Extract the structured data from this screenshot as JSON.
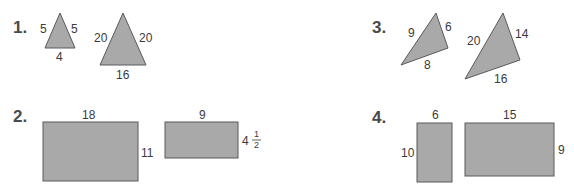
{
  "problems": [
    {
      "number": "1.",
      "type": "triangles",
      "figures": [
        {
          "sides": {
            "left": "5",
            "right": "5",
            "bottom": "4"
          }
        },
        {
          "sides": {
            "left": "20",
            "right": "20",
            "bottom": "16"
          }
        }
      ]
    },
    {
      "number": "2.",
      "type": "rectangles",
      "figures": [
        {
          "width": "18",
          "height": "11"
        },
        {
          "width": "9",
          "height_whole": "4",
          "height_frac_num": "1",
          "height_frac_den": "2"
        }
      ]
    },
    {
      "number": "3.",
      "type": "triangles",
      "figures": [
        {
          "sides": {
            "left": "9",
            "right": "6",
            "bottom": "8"
          }
        },
        {
          "sides": {
            "left": "20",
            "right": "14",
            "bottom": "16"
          }
        }
      ]
    },
    {
      "number": "4.",
      "type": "rectangles",
      "figures": [
        {
          "width": "6",
          "height": "10"
        },
        {
          "width": "15",
          "height": "9"
        }
      ]
    }
  ],
  "colors": {
    "fill": "#a9a9a9",
    "stroke": "#5a5a5a",
    "text": "#3a3a3a"
  }
}
